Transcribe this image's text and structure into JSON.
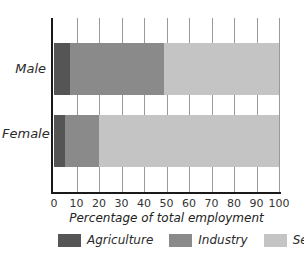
{
  "chart_data": {
    "type": "bar",
    "orientation": "horizontal",
    "stacked": true,
    "title": "",
    "xlabel": "Percentage of total employment",
    "ylabel": "",
    "xlim": [
      0,
      100
    ],
    "xticks": [
      0,
      10,
      20,
      30,
      40,
      50,
      60,
      70,
      80,
      90,
      100
    ],
    "grid": "vertical",
    "categories": [
      "Male",
      "Female"
    ],
    "series": [
      {
        "name": "Agriculture",
        "color": "#555555",
        "values": [
          7,
          5
        ]
      },
      {
        "name": "Industry",
        "color": "#8a8a8a",
        "values": [
          42,
          15
        ]
      },
      {
        "name": "Services",
        "color": "#c4c4c4",
        "values": [
          51,
          80
        ]
      }
    ],
    "legend_position": "bottom"
  },
  "labels": {
    "male": "Male",
    "female": "Female",
    "xlabel": "Percentage of total employment",
    "ticks": [
      "0",
      "10",
      "20",
      "30",
      "40",
      "50",
      "60",
      "70",
      "80",
      "90",
      "100"
    ],
    "legend": [
      "Agriculture",
      "Industry",
      "Services"
    ]
  }
}
